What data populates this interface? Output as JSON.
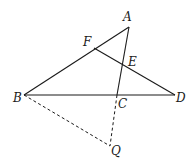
{
  "diagram": {
    "points": {
      "A": {
        "label": "A",
        "x": 129,
        "y": 27,
        "lx": 123,
        "ly": 21
      },
      "F": {
        "label": "F",
        "x": 94,
        "y": 48,
        "lx": 83,
        "ly": 46
      },
      "E": {
        "label": "E",
        "x": 124,
        "y": 65,
        "lx": 128,
        "ly": 66
      },
      "B": {
        "label": "B",
        "x": 24,
        "y": 95,
        "lx": 13,
        "ly": 102
      },
      "C": {
        "label": "C",
        "x": 117,
        "y": 95,
        "lx": 118,
        "ly": 108
      },
      "D": {
        "label": "D",
        "x": 175,
        "y": 95,
        "lx": 176,
        "ly": 102
      },
      "Q": {
        "label": "Q",
        "x": 110,
        "y": 146,
        "lx": 111,
        "ly": 155
      }
    },
    "solid_segments": [
      [
        "B",
        "A"
      ],
      [
        "A",
        "C"
      ],
      [
        "B",
        "D"
      ],
      [
        "F",
        "D"
      ]
    ],
    "dashed_segments": [
      [
        "B",
        "Q"
      ],
      [
        "C",
        "Q"
      ]
    ]
  }
}
